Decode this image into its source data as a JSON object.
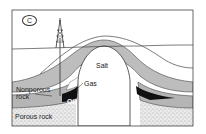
{
  "figure": {
    "panel_letter": "C",
    "labels": {
      "salt": "Salt",
      "gas": "Gas",
      "oil": "Oil",
      "nonporous_rock_line1": "Nonporous",
      "nonporous_rock_line2": "rock",
      "porous_rock": "Porous rock"
    },
    "icons": {
      "derrick": "oil-derrick-icon"
    },
    "colors": {
      "frame": "#444444",
      "nonporous": "#b8b8b8",
      "oil": "#111111",
      "porous": "#e6e6e6",
      "background": "#ffffff"
    }
  }
}
